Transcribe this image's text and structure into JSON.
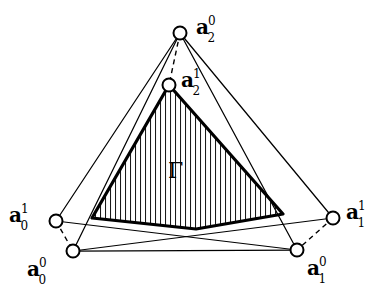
{
  "figure": {
    "width": 387,
    "height": 295,
    "background": "#ffffff",
    "ink": "#000000"
  },
  "region": {
    "label": "Γ",
    "name": "gamma-region",
    "x": 168,
    "y": 160,
    "hatch": {
      "style": "vertical-lines",
      "spacing": 5,
      "stroke_width": 1.1,
      "color": "#1a1a1a"
    }
  },
  "vertices": [
    {
      "id": "a2-0",
      "base": "a",
      "sub": "2",
      "sup": "0",
      "cx": 180,
      "cy": 33,
      "r": 6.5,
      "label_x": 196,
      "label_y": 16,
      "name": "vertex-a2-upper0"
    },
    {
      "id": "a2-1",
      "base": "a",
      "sub": "2",
      "sup": "1",
      "cx": 169,
      "cy": 85,
      "r": 6.5,
      "label_x": 181,
      "label_y": 69,
      "name": "vertex-a2-upper1"
    },
    {
      "id": "a0-1",
      "base": "a",
      "sub": "0",
      "sup": "1",
      "cx": 56,
      "cy": 221,
      "r": 6.5,
      "label_x": 9,
      "label_y": 204,
      "name": "vertex-a0-upper1"
    },
    {
      "id": "a1-1",
      "base": "a",
      "sub": "1",
      "sup": "1",
      "cx": 333,
      "cy": 218,
      "r": 6.5,
      "label_x": 346,
      "label_y": 201,
      "name": "vertex-a1-upper1"
    },
    {
      "id": "a0-0",
      "base": "a",
      "sub": "0",
      "sup": "0",
      "cx": 73,
      "cy": 251,
      "r": 6.5,
      "label_x": 27,
      "label_y": 258,
      "name": "vertex-a0-upper0"
    },
    {
      "id": "a1-0",
      "base": "a",
      "sub": "1",
      "sup": "0",
      "cx": 297,
      "cy": 250,
      "r": 6.5,
      "label_x": 307,
      "label_y": 257,
      "name": "vertex-a1-upper0"
    }
  ],
  "shaded_triangle": {
    "name": "gamma-triangle",
    "apex": [
      169,
      85
    ],
    "left_base": [
      92,
      218
    ],
    "dip": [
      196,
      229
    ],
    "right_base": [
      283,
      214
    ],
    "stroke_width": 3.2,
    "stroke": "#000000",
    "fill": "#ffffff"
  },
  "solid_edges": [
    {
      "name": "edge-a2-0-to-a0-1",
      "from": [
        180,
        33
      ],
      "to": [
        56,
        221
      ]
    },
    {
      "name": "edge-a2-0-to-a0-0",
      "from": [
        180,
        33
      ],
      "to": [
        73,
        251
      ]
    },
    {
      "name": "edge-a2-0-to-a1-0",
      "from": [
        180,
        33
      ],
      "to": [
        297,
        250
      ]
    },
    {
      "name": "edge-a2-0-to-a1-1",
      "from": [
        180,
        33
      ],
      "to": [
        333,
        218
      ]
    },
    {
      "name": "edge-a0-1-to-a1-0",
      "from": [
        56,
        221
      ],
      "to": [
        297,
        250
      ]
    },
    {
      "name": "edge-a1-1-to-a0-0",
      "from": [
        333,
        218
      ],
      "to": [
        73,
        251
      ]
    },
    {
      "name": "edge-a0-0-to-a1-0",
      "from": [
        73,
        251
      ],
      "to": [
        297,
        250
      ]
    }
  ],
  "dashed_edges": [
    {
      "name": "dashed-a2-0-to-a2-1",
      "from": [
        180,
        33
      ],
      "to": [
        169,
        85
      ]
    },
    {
      "name": "dashed-a0-1-to-a0-0",
      "from": [
        56,
        221
      ],
      "to": [
        73,
        251
      ]
    },
    {
      "name": "dashed-a1-1-to-a1-0",
      "from": [
        333,
        218
      ],
      "to": [
        297,
        250
      ]
    }
  ]
}
